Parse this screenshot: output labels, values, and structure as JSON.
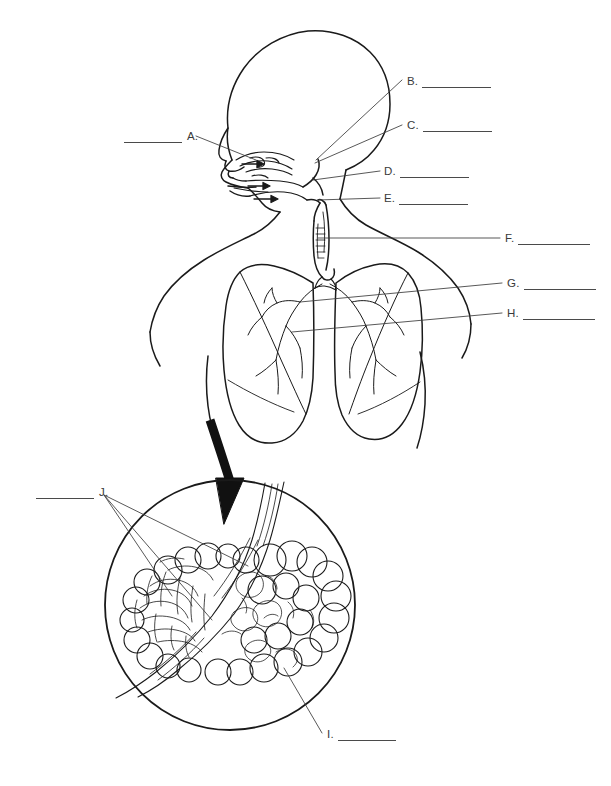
{
  "document": {
    "type": "anatomy-labeling-worksheet",
    "subject": "Human Respiratory System",
    "page_background": "#ffffff",
    "line_color": "#1a1a1a",
    "blank_color": "#4a4a4a",
    "label_text_color": "#3a3a3a"
  },
  "figure": {
    "main_view": {
      "name": "head-neck-thorax-cutaway",
      "description": "Sagittal profile of head facing left with nasal cavity, oral cavity, pharynx, larynx, trachea and anterior view of thorax with both lungs and bronchial trees"
    },
    "inset_view": {
      "name": "alveoli-magnification-circle",
      "description": "Circular magnified detail of terminal bronchiole, alveolar sacs and surrounding capillary network"
    },
    "arrow": {
      "name": "magnification-arrow",
      "description": "Thick curved arrow from base of left lung pointing down into the magnification circle"
    }
  },
  "labels": [
    {
      "id": "A",
      "letter": "A.",
      "answer": "",
      "blank_side": "left",
      "letter_x": 183,
      "letter_y": 132,
      "blank_width": 58
    },
    {
      "id": "B",
      "letter": "B.",
      "answer": "",
      "blank_side": "right",
      "letter_x": 407,
      "letter_y": 77,
      "blank_width": 69
    },
    {
      "id": "C",
      "letter": "C.",
      "answer": "",
      "blank_side": "right",
      "letter_x": 407,
      "letter_y": 121,
      "blank_width": 69
    },
    {
      "id": "D",
      "letter": "D.",
      "answer": "",
      "blank_side": "right",
      "letter_x": 384,
      "letter_y": 167,
      "blank_width": 69
    },
    {
      "id": "E",
      "letter": "E.",
      "answer": "",
      "blank_side": "right",
      "letter_x": 384,
      "letter_y": 194,
      "blank_width": 69
    },
    {
      "id": "F",
      "letter": "F.",
      "answer": "",
      "blank_side": "right",
      "letter_x": 505,
      "letter_y": 234,
      "blank_width": 72
    },
    {
      "id": "G",
      "letter": "G.",
      "answer": "",
      "blank_side": "right",
      "letter_x": 507,
      "letter_y": 279,
      "blank_width": 72
    },
    {
      "id": "H",
      "letter": "H.",
      "answer": "",
      "blank_side": "right",
      "letter_x": 507,
      "letter_y": 309,
      "blank_width": 72
    },
    {
      "id": "I",
      "letter": "I.",
      "answer": "",
      "blank_side": "right",
      "letter_x": 327,
      "letter_y": 730,
      "blank_width": 58
    },
    {
      "id": "J",
      "letter": "J.",
      "answer": "",
      "blank_side": "left",
      "letter_x": 94,
      "letter_y": 488,
      "blank_width": 58
    }
  ]
}
